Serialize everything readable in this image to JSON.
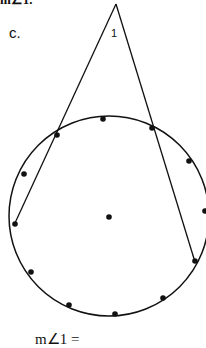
{
  "header_fragment": "m∠1.",
  "part_label": "c.",
  "angle_label": "1",
  "answer_prompt": "m∠1 =",
  "diagram": {
    "circle": {
      "cx": 109,
      "cy": 216,
      "r": 100
    },
    "apex": [
      116,
      4
    ],
    "secant_left": {
      "from": [
        116,
        4
      ],
      "near": [
        57,
        132
      ],
      "far": [
        15,
        223
      ]
    },
    "secant_right": {
      "from": [
        116,
        4
      ],
      "near": [
        152,
        128
      ],
      "far": [
        194,
        261
      ]
    },
    "points": [
      [
        103,
        119
      ],
      [
        57,
        132
      ],
      [
        152,
        128
      ],
      [
        24,
        174
      ],
      [
        189,
        161
      ],
      [
        206,
        211
      ],
      [
        15,
        223
      ],
      [
        109,
        217
      ],
      [
        195,
        261
      ],
      [
        32,
        272
      ],
      [
        69,
        305
      ],
      [
        115,
        314
      ],
      [
        163,
        297
      ]
    ]
  }
}
